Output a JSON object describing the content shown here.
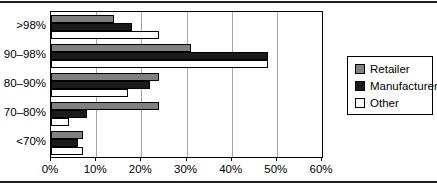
{
  "chart_data": {
    "type": "bar",
    "orientation": "horizontal",
    "title": "",
    "xlabel": "",
    "ylabel": "",
    "categories": [
      ">98%",
      "90–98%",
      "80–90%",
      "70–80%",
      "<70%"
    ],
    "series": [
      {
        "name": "Retailer",
        "color": "#808080",
        "values": [
          14,
          31,
          24,
          24,
          7
        ]
      },
      {
        "name": "Manufacturer",
        "color": "#1a1a1a",
        "values": [
          18,
          48,
          22,
          8,
          6
        ]
      },
      {
        "name": "Other",
        "color": "#ffffff",
        "values": [
          24,
          48,
          17,
          4,
          7
        ]
      }
    ],
    "xlim": [
      0,
      60
    ],
    "x_ticks": [
      "0%",
      "10%",
      "20%",
      "30%",
      "40%",
      "50%",
      "60%"
    ],
    "grid": "vertical",
    "legend_position": "right",
    "bar_border_color": "#000000",
    "gridline_color": "#a6a6a6",
    "frame_color": "#000000",
    "rule_color": "#1f1f1f"
  }
}
